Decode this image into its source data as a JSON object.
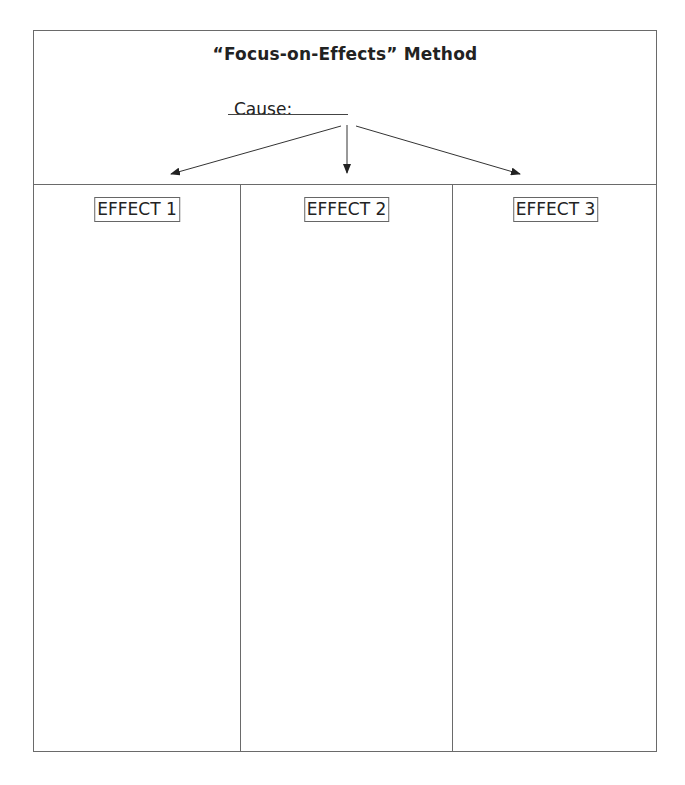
{
  "title": "“Focus-on-Effects” Method",
  "cause": {
    "label": "Cause:",
    "value": ""
  },
  "effects": [
    {
      "label": "EFFECT 1",
      "content": ""
    },
    {
      "label": "EFFECT 2",
      "content": ""
    },
    {
      "label": "EFFECT 3",
      "content": ""
    }
  ]
}
